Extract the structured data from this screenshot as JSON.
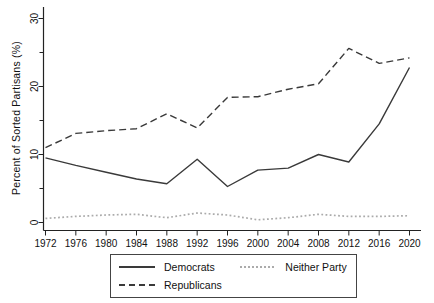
{
  "chart_data": {
    "type": "line",
    "title": "",
    "xlabel": "",
    "ylabel": "Percent of Sorted Partisans (%)",
    "ylim": [
      0,
      30
    ],
    "y_major_ticks": [
      0,
      10,
      20,
      30
    ],
    "y_minor_ticks": [
      5,
      15,
      25
    ],
    "grid": false,
    "legend_position": "bottom",
    "x": [
      1972,
      1976,
      1980,
      1984,
      1988,
      1992,
      1996,
      2000,
      2004,
      2008,
      2012,
      2016,
      2020
    ],
    "series": [
      {
        "name": "Democrats",
        "style": "solid",
        "color": "#3a3a3a",
        "values": [
          9.5,
          8.4,
          7.4,
          6.4,
          5.7,
          9.3,
          5.3,
          7.7,
          8.0,
          10.0,
          8.9,
          14.5,
          22.8
        ]
      },
      {
        "name": "Republicans",
        "style": "dashed",
        "color": "#3a3a3a",
        "values": [
          11.0,
          13.1,
          13.5,
          13.8,
          16.0,
          13.9,
          18.4,
          18.5,
          19.6,
          20.4,
          25.6,
          23.4,
          24.2
        ]
      },
      {
        "name": "Neither Party",
        "style": "dotted",
        "color": "#ababab",
        "values": [
          0.6,
          0.9,
          1.1,
          1.2,
          0.7,
          1.4,
          1.1,
          0.4,
          0.7,
          1.2,
          0.9,
          0.9,
          1.0
        ]
      }
    ],
    "axis_color": "#222222",
    "text_color": "#111111"
  }
}
